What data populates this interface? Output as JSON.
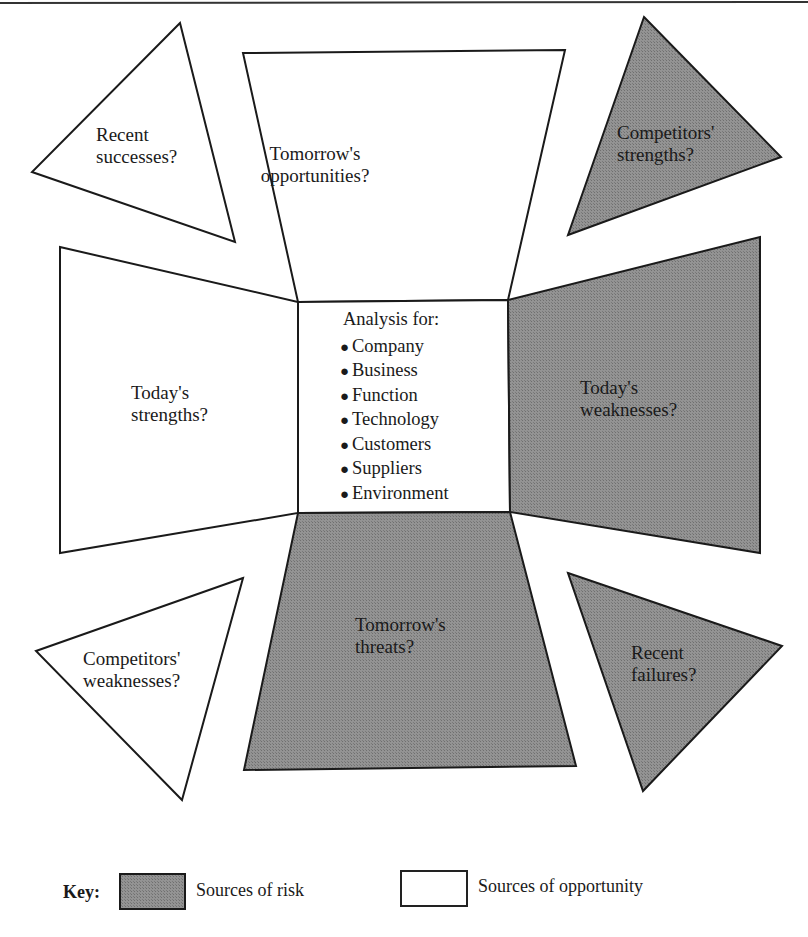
{
  "colors": {
    "risk_fill": "#8e8e8e",
    "opportunity_fill": "#ffffff",
    "stroke": "#1a1a1a"
  },
  "diagram": {
    "center": {
      "title": "Analysis for:",
      "items": [
        "Company",
        "Business",
        "Function",
        "Technology",
        "Customers",
        "Suppliers",
        "Environment"
      ]
    },
    "panels": {
      "recent_successes": {
        "line1": "Recent",
        "line2": "successes?",
        "type": "opportunity"
      },
      "tomorrows_opportunities": {
        "line1": "Tomorrow's",
        "line2": "opportunities?",
        "type": "opportunity"
      },
      "competitors_strengths": {
        "line1": "Competitors'",
        "line2": "strengths?",
        "type": "risk"
      },
      "todays_strengths": {
        "line1": "Today's",
        "line2": "strengths?",
        "type": "opportunity"
      },
      "todays_weaknesses": {
        "line1": "Today's",
        "line2": "weaknesses?",
        "type": "risk"
      },
      "competitors_weaknesses": {
        "line1": "Competitors'",
        "line2": "weaknesses?",
        "type": "opportunity"
      },
      "tomorrows_threats": {
        "line1": "Tomorrow's",
        "line2": "threats?",
        "type": "risk"
      },
      "recent_failures": {
        "line1": "Recent",
        "line2": "failures?",
        "type": "risk"
      }
    }
  },
  "legend": {
    "key_label": "Key:",
    "risk_label": "Sources of risk",
    "opportunity_label": "Sources of opportunity"
  }
}
